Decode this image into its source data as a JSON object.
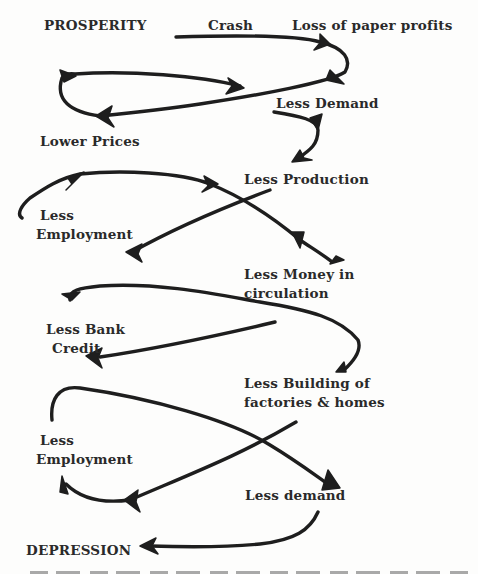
{
  "diagram": {
    "type": "flow-cycle",
    "nodes": [
      {
        "id": "prosperity",
        "label": "PROSPERITY"
      },
      {
        "id": "crash",
        "label": "Crash"
      },
      {
        "id": "loss",
        "label": "Loss of paper profits"
      },
      {
        "id": "less_demand_1",
        "label": "Less Demand"
      },
      {
        "id": "lower_prices",
        "label": "Lower Prices"
      },
      {
        "id": "less_production",
        "label": "Less Production"
      },
      {
        "id": "less_employment_1",
        "label_line1": "Less",
        "label_line2": "Employment"
      },
      {
        "id": "less_money",
        "label_line1": "Less Money in",
        "label_line2": "circulation"
      },
      {
        "id": "less_bank_credit",
        "label_line1": "Less Bank",
        "label_line2": "Credit"
      },
      {
        "id": "less_building",
        "label_line1": "Less Building of",
        "label_line2": "factories & homes"
      },
      {
        "id": "less_employment_2",
        "label_line1": "Less",
        "label_line2": "Employment"
      },
      {
        "id": "less_demand_2",
        "label": "Less demand"
      },
      {
        "id": "depression",
        "label": "DEPRESSION"
      }
    ],
    "edges": [
      {
        "from": "crash",
        "to": "loss"
      },
      {
        "from": "loss",
        "to": "lower_prices"
      },
      {
        "from": "lower_prices",
        "to": "less_demand_1"
      },
      {
        "from": "less_demand_1",
        "to": "less_production"
      },
      {
        "from": "less_production",
        "to": "less_employment_1"
      },
      {
        "from": "less_employment_1",
        "to": "less_money"
      },
      {
        "from": "less_money",
        "to": "less_bank_credit"
      },
      {
        "from": "less_bank_credit",
        "to": "less_building"
      },
      {
        "from": "less_building",
        "to": "less_employment_2"
      },
      {
        "from": "less_employment_2",
        "to": "less_demand_2"
      },
      {
        "from": "less_demand_2",
        "to": "depression"
      }
    ]
  }
}
